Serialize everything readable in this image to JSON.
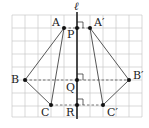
{
  "figure": {
    "type": "line-symmetry-diagram",
    "axis_label": "ℓ",
    "colors": {
      "grid": "#c8c8c8",
      "axis": "#222222",
      "edges": "#444444",
      "dashed": "#555555",
      "points": "#111111",
      "background": "#ffffff"
    },
    "grid": {
      "cols": 10,
      "rows": 7,
      "cell": 13
    },
    "points": [
      {
        "name": "A",
        "label": "A",
        "x": 64,
        "y": 28
      },
      {
        "name": "P",
        "label": "P",
        "x": 77,
        "y": 28
      },
      {
        "name": "A'",
        "label": "A′",
        "x": 90,
        "y": 28
      },
      {
        "name": "B",
        "label": "B",
        "x": 25,
        "y": 80
      },
      {
        "name": "Q",
        "label": "Q",
        "x": 77,
        "y": 80
      },
      {
        "name": "B'",
        "label": "B′",
        "x": 129,
        "y": 80
      },
      {
        "name": "C",
        "label": "C",
        "x": 51,
        "y": 105
      },
      {
        "name": "R",
        "label": "R",
        "x": 77,
        "y": 105
      },
      {
        "name": "C'",
        "label": "C′",
        "x": 103,
        "y": 105
      }
    ],
    "triangles": [
      {
        "name": "ABC",
        "vertices": [
          "A",
          "B",
          "C"
        ]
      },
      {
        "name": "A'B'C'",
        "vertices": [
          "A'",
          "B'",
          "C'"
        ]
      }
    ],
    "dashed_segments": [
      [
        "A",
        "A'"
      ],
      [
        "B",
        "B'"
      ],
      [
        "C",
        "C'"
      ]
    ],
    "right_angle_marks": [
      "P",
      "Q",
      "R"
    ]
  }
}
